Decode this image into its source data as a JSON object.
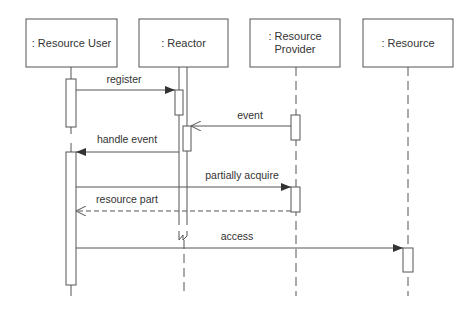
{
  "diagram": {
    "type": "uml-sequence",
    "colors": {
      "line": "#555555",
      "text": "#333333",
      "background": "#ffffff"
    },
    "participants": [
      {
        "id": "user",
        "label": ": Resource User",
        "lines": [
          ": Resource User"
        ]
      },
      {
        "id": "reactor",
        "label": ": Reactor",
        "lines": [
          ": Reactor"
        ]
      },
      {
        "id": "provider",
        "label": ": Resource Provider",
        "lines": [
          ": Resource",
          "Provider"
        ]
      },
      {
        "id": "resource",
        "label": ": Resource",
        "lines": [
          ": Resource"
        ]
      }
    ],
    "messages": [
      {
        "label": "register",
        "from": "user",
        "to": "reactor",
        "style": "sync"
      },
      {
        "label": "event",
        "from": "provider",
        "to": "reactor",
        "style": "async"
      },
      {
        "label": "handle event",
        "from": "reactor",
        "to": "user",
        "style": "sync"
      },
      {
        "label": "partially acquire",
        "from": "user",
        "to": "provider",
        "style": "sync"
      },
      {
        "label": "resource part",
        "from": "provider",
        "to": "user",
        "style": "return"
      },
      {
        "label": "access",
        "from": "user",
        "to": "resource",
        "style": "sync"
      }
    ]
  }
}
